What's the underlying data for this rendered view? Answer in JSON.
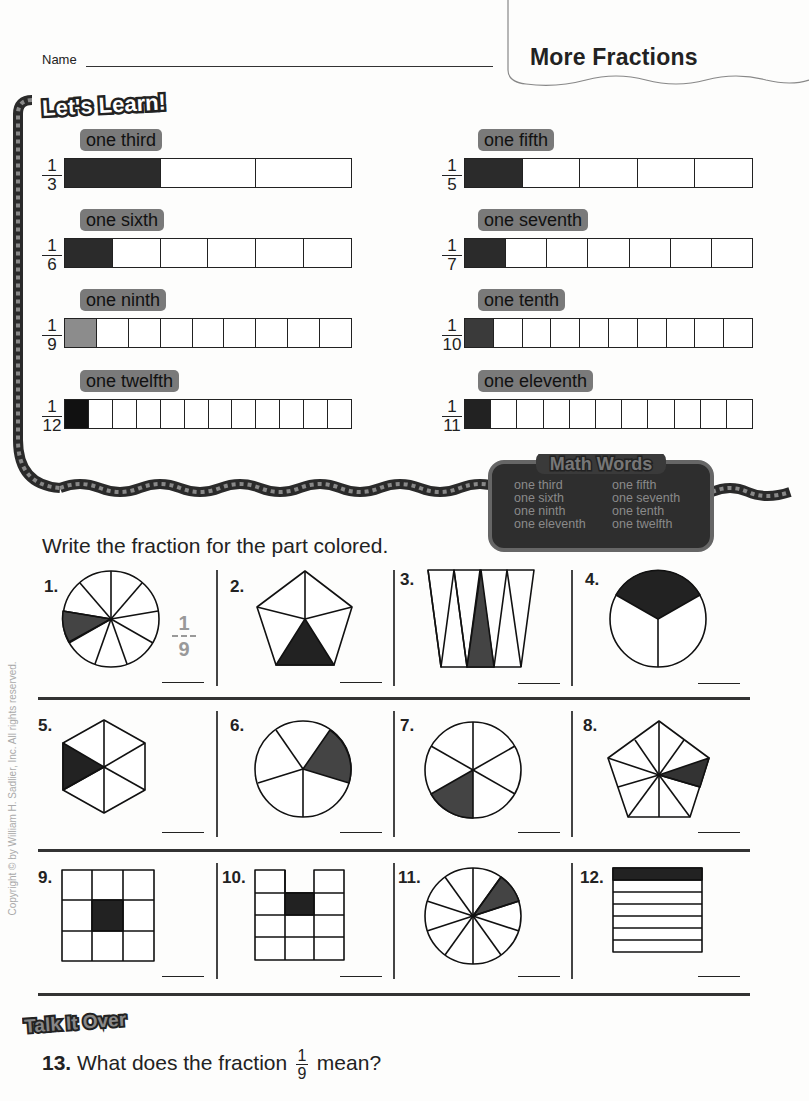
{
  "header": {
    "name_label": "Name",
    "title": "More Fractions"
  },
  "lets_learn": {
    "banner": "Let's Learn!",
    "bars": [
      {
        "word": "one third",
        "num": "1",
        "den": "3",
        "parts": 3,
        "shaded": 1,
        "fill": "#2b2b2b"
      },
      {
        "word": "one fifth",
        "num": "1",
        "den": "5",
        "parts": 5,
        "shaded": 1,
        "fill": "#2b2b2b"
      },
      {
        "word": "one sixth",
        "num": "1",
        "den": "6",
        "parts": 6,
        "shaded": 1,
        "fill": "#2b2b2b"
      },
      {
        "word": "one seventh",
        "num": "1",
        "den": "7",
        "parts": 7,
        "shaded": 1,
        "fill": "#2b2b2b"
      },
      {
        "word": "one ninth",
        "num": "1",
        "den": "9",
        "parts": 9,
        "shaded": 1,
        "fill": "#8c8c8c"
      },
      {
        "word": "one tenth",
        "num": "1",
        "den": "10",
        "parts": 10,
        "shaded": 1,
        "fill": "#3a3a3a"
      },
      {
        "word": "one twelfth",
        "num": "1",
        "den": "12",
        "parts": 12,
        "shaded": 1,
        "fill": "#111111"
      },
      {
        "word": "one eleventh",
        "num": "1",
        "den": "11",
        "parts": 11,
        "shaded": 1,
        "fill": "#222222"
      }
    ]
  },
  "math_words": {
    "title": "Math Words",
    "words": [
      "one third",
      "one fifth",
      "one sixth",
      "one seventh",
      "one ninth",
      "one tenth",
      "one eleventh",
      "one twelfth"
    ]
  },
  "exercise": {
    "instruction": "Write the fraction for the part colored.",
    "problems": [
      {
        "num": "1.",
        "shape": "circle",
        "parts": 9,
        "shaded": 1,
        "example_answer": {
          "num": "1",
          "den": "9"
        }
      },
      {
        "num": "2.",
        "shape": "pentagon",
        "parts": 5,
        "shaded": 1
      },
      {
        "num": "3.",
        "shape": "trapezoid-triangles",
        "parts": 7,
        "shaded": 1
      },
      {
        "num": "4.",
        "shape": "circle",
        "parts": 3,
        "shaded": 1
      },
      {
        "num": "5.",
        "shape": "hexagon",
        "parts": 6,
        "shaded": 1
      },
      {
        "num": "6.",
        "shape": "circle",
        "parts": 5,
        "shaded": 1
      },
      {
        "num": "7.",
        "shape": "circle",
        "parts": 6,
        "shaded": 1
      },
      {
        "num": "8.",
        "shape": "pentagon",
        "parts": 10,
        "shaded": 1
      },
      {
        "num": "9.",
        "shape": "grid",
        "parts": 9,
        "shaded": 1
      },
      {
        "num": "10.",
        "shape": "grid",
        "parts": 11,
        "shaded": 1
      },
      {
        "num": "11.",
        "shape": "circle",
        "parts": 10,
        "shaded": 1
      },
      {
        "num": "12.",
        "shape": "stripes",
        "parts": 7,
        "shaded": 1
      }
    ]
  },
  "talk_it_over": {
    "banner": "Talk It Over",
    "question_num": "13.",
    "question_pre": "What does the fraction",
    "fraction_num": "1",
    "fraction_den": "9",
    "question_post": "mean?"
  },
  "copyright": "Copyright © by William H. Sadlier, Inc. All rights reserved."
}
